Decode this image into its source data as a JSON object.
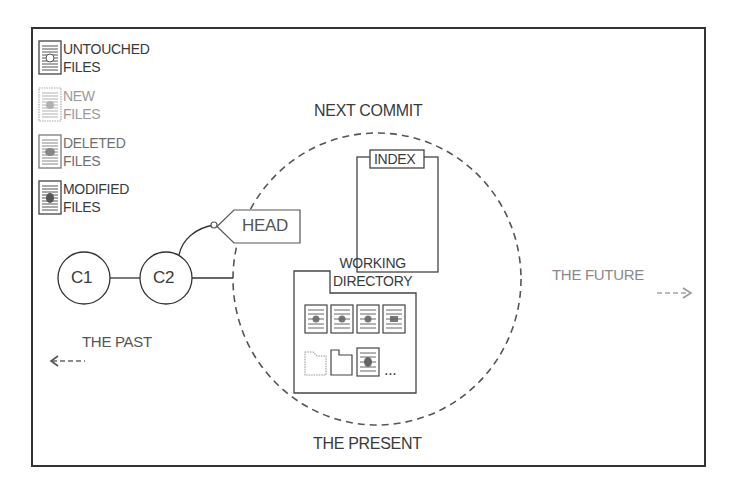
{
  "legend": [
    {
      "line1": "UNTOUCHED",
      "line2": "FILES",
      "icon": "untouched-file-icon",
      "color": "#3a3a3a"
    },
    {
      "line1": "NEW",
      "line2": "FILES",
      "icon": "new-file-icon",
      "color": "#9a9a9a"
    },
    {
      "line1": "DELETED",
      "line2": "FILES",
      "icon": "deleted-file-icon",
      "color": "#6f6f6f"
    },
    {
      "line1": "MODIFIED",
      "line2": "FILES",
      "icon": "modified-file-icon",
      "color": "#3a3a3a"
    }
  ],
  "commits": [
    {
      "label": "C1"
    },
    {
      "label": "C2"
    }
  ],
  "head_tag": "HEAD",
  "next_commit": "NEXT COMMIT",
  "index_label": "INDEX",
  "working_directory": {
    "line1": "WORKING",
    "line2": "DIRECTORY",
    "more": "..."
  },
  "the_present": "THE PRESENT",
  "the_past": "THE PAST",
  "the_future": "THE FUTURE",
  "colors": {
    "line": "#333333",
    "dash": "#555555",
    "faded": "#9a9a9a"
  }
}
